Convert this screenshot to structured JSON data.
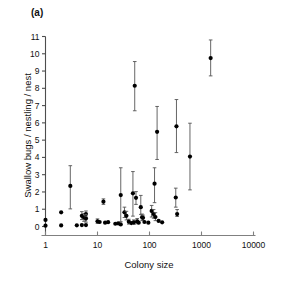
{
  "figure": {
    "panel_label": "(a)",
    "xlabel": "Colony size",
    "ylabel": "Swallow bugs / nestling / nest"
  },
  "chart_data": {
    "type": "scatter",
    "title": "",
    "subtitle": "",
    "panel": "(a)",
    "xlabel": "Colony size",
    "ylabel": "Swallow bugs / nestling / nest",
    "xscale": "log",
    "yscale": "linear",
    "xlim": [
      1,
      10000
    ],
    "ylim": [
      0,
      11
    ],
    "xticks": [
      1,
      10,
      100,
      1000,
      10000
    ],
    "xticklabels": [
      "1",
      "10",
      "100",
      "1000",
      "10000"
    ],
    "yticks": [
      0,
      1,
      2,
      3,
      4,
      5,
      6,
      7,
      8,
      9,
      10,
      11
    ],
    "yticklabels": [
      "0",
      "1",
      "2",
      "3",
      "4",
      "5",
      "6",
      "7",
      "8",
      "9",
      "10",
      "11"
    ],
    "grid": false,
    "legend": null,
    "marker": "filled-circle",
    "marker_color": "#000000",
    "errorbar_color": "#555555",
    "errorbar_type": "standard-error",
    "series": [
      {
        "name": "Swallow bugs per nestling per nest",
        "points": [
          {
            "x": 1,
            "y": 0.38,
            "ylo": 0.38,
            "yhi": 0.38
          },
          {
            "x": 1,
            "y": 0.05,
            "ylo": 0.05,
            "yhi": 0.05
          },
          {
            "x": 2,
            "y": 0.82,
            "ylo": 0.82,
            "yhi": 0.82
          },
          {
            "x": 2,
            "y": 0.06,
            "ylo": 0.06,
            "yhi": 0.06
          },
          {
            "x": 3,
            "y": 2.35,
            "ylo": 1.02,
            "yhi": 3.52
          },
          {
            "x": 4,
            "y": 0.07,
            "ylo": 0.07,
            "yhi": 0.07
          },
          {
            "x": 5,
            "y": 0.62,
            "ylo": 0.4,
            "yhi": 0.86
          },
          {
            "x": 5,
            "y": 0.08,
            "ylo": 0.08,
            "yhi": 0.08
          },
          {
            "x": 5.5,
            "y": 0.52,
            "ylo": 0.3,
            "yhi": 0.75
          },
          {
            "x": 6,
            "y": 0.72,
            "ylo": 0.55,
            "yhi": 0.9
          },
          {
            "x": 6,
            "y": 0.46,
            "ylo": 0.25,
            "yhi": 0.7
          },
          {
            "x": 6,
            "y": 0.08,
            "ylo": 0.08,
            "yhi": 0.08
          },
          {
            "x": 10,
            "y": 0.3,
            "ylo": 0.18,
            "yhi": 0.44
          },
          {
            "x": 11,
            "y": 0.26,
            "ylo": 0.26,
            "yhi": 0.26
          },
          {
            "x": 13,
            "y": 1.44,
            "ylo": 1.28,
            "yhi": 1.6
          },
          {
            "x": 14,
            "y": 0.22,
            "ylo": 0.22,
            "yhi": 0.22
          },
          {
            "x": 16,
            "y": 0.25,
            "ylo": 0.25,
            "yhi": 0.25
          },
          {
            "x": 22,
            "y": 0.16,
            "ylo": 0.16,
            "yhi": 0.16
          },
          {
            "x": 25,
            "y": 0.18,
            "ylo": 0.18,
            "yhi": 0.18
          },
          {
            "x": 28,
            "y": 1.82,
            "ylo": 0.28,
            "yhi": 3.4
          },
          {
            "x": 28,
            "y": 0.12,
            "ylo": 0.12,
            "yhi": 0.12
          },
          {
            "x": 33,
            "y": 0.82,
            "ylo": 0.52,
            "yhi": 1.12
          },
          {
            "x": 36,
            "y": 0.62,
            "ylo": 0.38,
            "yhi": 0.88
          },
          {
            "x": 40,
            "y": 0.28,
            "ylo": 0.14,
            "yhi": 0.42
          },
          {
            "x": 45,
            "y": 0.2,
            "ylo": 0.2,
            "yhi": 0.2
          },
          {
            "x": 48,
            "y": 1.92,
            "ylo": 0.6,
            "yhi": 3.18
          },
          {
            "x": 50,
            "y": 0.24,
            "ylo": 0.12,
            "yhi": 0.38
          },
          {
            "x": 52,
            "y": 8.15,
            "ylo": 6.7,
            "yhi": 9.55
          },
          {
            "x": 55,
            "y": 1.66,
            "ylo": 1.28,
            "yhi": 2.02
          },
          {
            "x": 58,
            "y": 0.3,
            "ylo": 0.16,
            "yhi": 0.46
          },
          {
            "x": 62,
            "y": 0.22,
            "ylo": 0.22,
            "yhi": 0.22
          },
          {
            "x": 68,
            "y": 1.12,
            "ylo": 0.7,
            "yhi": 1.8
          },
          {
            "x": 72,
            "y": 0.54,
            "ylo": 0.36,
            "yhi": 0.72
          },
          {
            "x": 75,
            "y": 0.5,
            "ylo": 0.34,
            "yhi": 0.66
          },
          {
            "x": 80,
            "y": 0.26,
            "ylo": 0.26,
            "yhi": 0.26
          },
          {
            "x": 95,
            "y": 0.22,
            "ylo": 0.22,
            "yhi": 0.22
          },
          {
            "x": 110,
            "y": 0.9,
            "ylo": 0.55,
            "yhi": 1.22
          },
          {
            "x": 120,
            "y": 0.72,
            "ylo": 0.48,
            "yhi": 0.98
          },
          {
            "x": 125,
            "y": 2.48,
            "ylo": 1.38,
            "yhi": 3.4
          },
          {
            "x": 130,
            "y": 0.55,
            "ylo": 0.34,
            "yhi": 0.8
          },
          {
            "x": 140,
            "y": 5.48,
            "ylo": 3.88,
            "yhi": 6.95
          },
          {
            "x": 150,
            "y": 0.32,
            "ylo": 0.32,
            "yhi": 0.32
          },
          {
            "x": 175,
            "y": 0.24,
            "ylo": 0.24,
            "yhi": 0.24
          },
          {
            "x": 320,
            "y": 1.68,
            "ylo": 1.12,
            "yhi": 2.22
          },
          {
            "x": 330,
            "y": 5.8,
            "ylo": 4.28,
            "yhi": 7.35
          },
          {
            "x": 340,
            "y": 0.72,
            "ylo": 0.58,
            "yhi": 0.98
          },
          {
            "x": 600,
            "y": 4.05,
            "ylo": 2.12,
            "yhi": 5.98
          },
          {
            "x": 1500,
            "y": 9.75,
            "ylo": 8.72,
            "yhi": 10.8
          }
        ]
      }
    ]
  }
}
